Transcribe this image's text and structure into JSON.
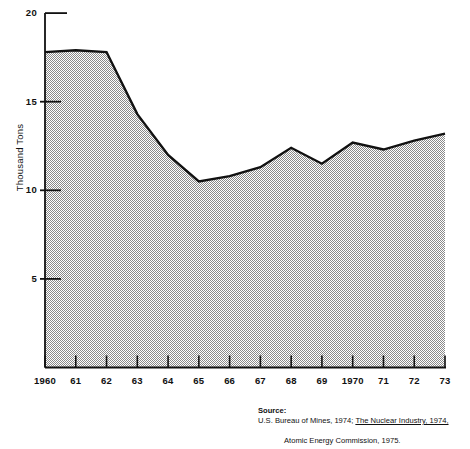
{
  "chart_data": {
    "type": "area",
    "title": "",
    "xlabel": "",
    "ylabel": "Thousand Tons",
    "x": [
      1960,
      1961,
      1962,
      1963,
      1964,
      1965,
      1966,
      1967,
      1968,
      1969,
      1970,
      1971,
      1972,
      1973
    ],
    "values": [
      17.8,
      17.9,
      17.8,
      14.3,
      12.0,
      10.5,
      10.8,
      11.3,
      12.4,
      11.5,
      12.7,
      12.3,
      12.8,
      13.2
    ],
    "xtick_labels": [
      "1960",
      "61",
      "62",
      "63",
      "64",
      "65",
      "66",
      "67",
      "68",
      "69",
      "1970",
      "71",
      "72",
      "73"
    ],
    "ytick_labels": [
      "5",
      "10",
      "15",
      "20"
    ],
    "ytick_values": [
      5,
      10,
      15,
      20
    ],
    "ylim": [
      0,
      20
    ],
    "xlim": [
      1960,
      1973
    ],
    "grid": false,
    "legend": "none",
    "fill_color": "#b5b5b5",
    "line_color": "#111111",
    "series": [
      {
        "name": "Thousand Tons",
        "values": [
          17.8,
          17.9,
          17.8,
          14.3,
          12.0,
          10.5,
          10.8,
          11.3,
          12.4,
          11.5,
          12.7,
          12.3,
          12.8,
          13.2
        ]
      }
    ]
  },
  "source": {
    "prefix": "Source:",
    "line1": "U.S. Bureau of Mines, 1974; ",
    "line1_italic": "The Nuclear Industry, 1974,",
    "line2": "Atomic Energy Commission, 1975."
  }
}
